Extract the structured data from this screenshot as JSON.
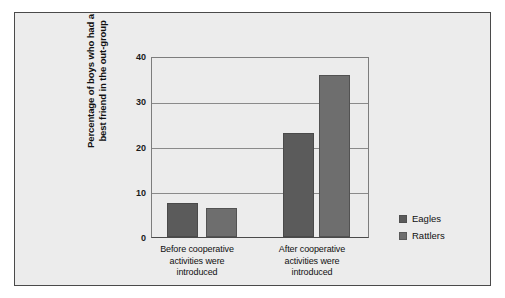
{
  "chart_data": {
    "type": "bar",
    "title": "",
    "xlabel": "",
    "ylabel": "Percentage of boys who had a best friend in the out-group",
    "ylabel_line1": "Percentage of boys who had a",
    "ylabel_line2": "best friend in the out-group",
    "ylim": [
      0,
      40
    ],
    "yticks": [
      0,
      10,
      20,
      30,
      40
    ],
    "ytick_labels": [
      "0",
      "10",
      "20",
      "30",
      "40"
    ],
    "grid": true,
    "grid_axis": "y",
    "legend_position": "right",
    "categories": [
      "Before cooperative activities were introduced",
      "After cooperative activities were introduced"
    ],
    "category_lines": [
      [
        "Before cooperative",
        "activities were",
        "introduced"
      ],
      [
        "After cooperative",
        "activities were",
        "introduced"
      ]
    ],
    "series": [
      {
        "name": "Eagles",
        "color": "#5b5b5b",
        "values": [
          7.5,
          23.2
        ]
      },
      {
        "name": "Rattlers",
        "color": "#6e6e6e",
        "values": [
          6.4,
          36.3
        ]
      }
    ]
  },
  "figure": {
    "panel_background": "#ececec",
    "panel_border": "#4a4a4a",
    "gridline_color": "#8a8a8a",
    "axis_color": "#4a4a4a"
  }
}
